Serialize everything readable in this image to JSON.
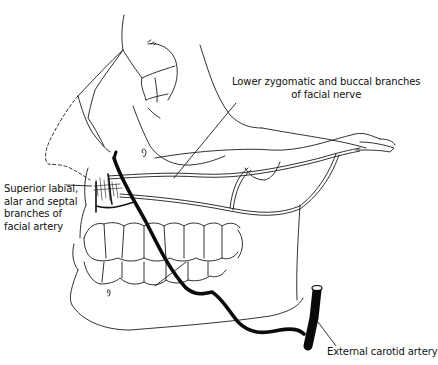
{
  "figure": {
    "type": "anatomical-illustration",
    "colors": {
      "background": "#ffffff",
      "line": "#1a1a1a",
      "artery": "#0a0a0a"
    }
  },
  "labels": {
    "nerve": {
      "line1": "Lower zygomatic and buccal branches",
      "line2": "of facial nerve"
    },
    "facial_artery_branches": {
      "line1": "Superior labial,",
      "line2": "alar and septal",
      "line3": "branches of",
      "line4": "facial artery"
    },
    "carotid": {
      "line1": "External carotid artery"
    }
  }
}
